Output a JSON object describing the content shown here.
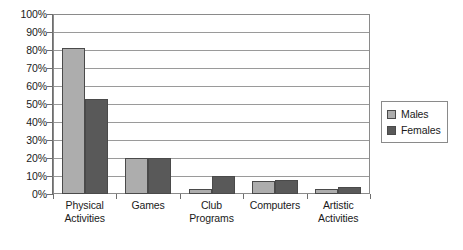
{
  "chart_data": {
    "type": "bar",
    "title": "",
    "subtitle": "",
    "xlabel": "",
    "ylabel": "",
    "categories": [
      "Physical Activities",
      "Games",
      "Club Programs",
      "Computers",
      "Artistic Activities"
    ],
    "category_lines": [
      [
        "Physical",
        "Activities"
      ],
      [
        "Games",
        ""
      ],
      [
        "Club",
        "Programs"
      ],
      [
        "Computers",
        ""
      ],
      [
        "Artistic",
        "Activities"
      ]
    ],
    "series": [
      {
        "name": "Males",
        "color": "#ADADAD",
        "values": [
          81,
          20,
          3,
          7,
          3
        ]
      },
      {
        "name": "Females",
        "color": "#595959",
        "values": [
          53,
          20,
          10,
          8,
          4
        ]
      }
    ],
    "ylim": [
      0,
      100
    ],
    "ytick_step": 10,
    "ytick_labels": [
      "0%",
      "10%",
      "20%",
      "30%",
      "40%",
      "50%",
      "60%",
      "70%",
      "80%",
      "90%",
      "100%"
    ],
    "ytick_values": [
      0,
      10,
      20,
      30,
      40,
      50,
      60,
      70,
      80,
      90,
      100
    ],
    "grid": true,
    "grid_axis": "y",
    "legend_position": "right",
    "legend_entries": [
      "Males",
      "Females"
    ]
  },
  "colors": {
    "males_fill": "#ADADAD",
    "females_fill": "#595959",
    "bar_border": "#4a4a4a",
    "gridline": "#9a9a9a",
    "axis": "#6e6e6e",
    "frame": "#8a8a8a",
    "background": "#ffffff",
    "text": "#1a1a1a"
  }
}
